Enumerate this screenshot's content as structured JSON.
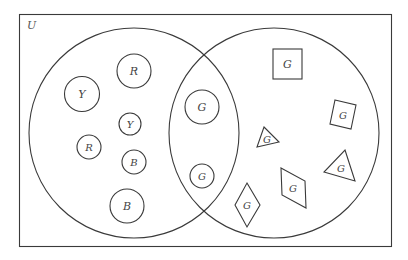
{
  "diagram": {
    "type": "venn",
    "universe": {
      "label": "U"
    },
    "sets": [
      {
        "id": "left",
        "description": "circles set"
      },
      {
        "id": "right",
        "description": "G-labeled set"
      }
    ],
    "elements": {
      "left_only": [
        {
          "shape": "circle",
          "label": "Y",
          "size": "large"
        },
        {
          "shape": "circle",
          "label": "R",
          "size": "large"
        },
        {
          "shape": "circle",
          "label": "Y",
          "size": "small"
        },
        {
          "shape": "circle",
          "label": "R",
          "size": "small"
        },
        {
          "shape": "circle",
          "label": "B",
          "size": "small"
        },
        {
          "shape": "circle",
          "label": "B",
          "size": "large"
        }
      ],
      "intersection": [
        {
          "shape": "circle",
          "label": "G",
          "size": "large"
        },
        {
          "shape": "circle",
          "label": "G",
          "size": "small"
        }
      ],
      "right_only": [
        {
          "shape": "square",
          "label": "G",
          "size": "large"
        },
        {
          "shape": "square",
          "label": "G",
          "size": "small",
          "rotated": true
        },
        {
          "shape": "triangle",
          "label": "G",
          "size": "small"
        },
        {
          "shape": "triangle",
          "label": "G",
          "size": "large"
        },
        {
          "shape": "parallelogram",
          "label": "G"
        },
        {
          "shape": "rhombus",
          "label": "G"
        }
      ]
    },
    "colors": {
      "line": "#3a3a3a",
      "text": "#444444",
      "background": "#ffffff"
    }
  }
}
